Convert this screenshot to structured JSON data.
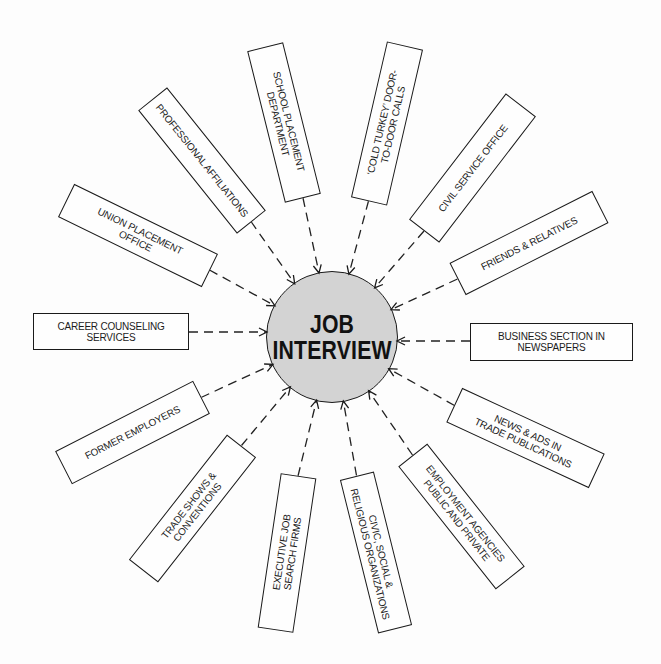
{
  "diagram": {
    "center": {
      "lines": [
        "JOB",
        "INTERVIEW"
      ]
    },
    "sources": [
      {
        "lines": [
          "SCHOOL PLACEMENT",
          "DEPARTMENT"
        ]
      },
      {
        "lines": [
          "‘COLD TURKEY’ DOOR-",
          "TO-DOOR CALLS"
        ]
      },
      {
        "lines": [
          "CIVIL SERVICE OFFICE"
        ]
      },
      {
        "lines": [
          "FRIENDS & RELATIVES"
        ]
      },
      {
        "lines": [
          "BUSINESS SECTION IN",
          "NEWSPAPERS"
        ]
      },
      {
        "lines": [
          "NEWS & ADS IN",
          "TRADE PUBLICATIONS"
        ]
      },
      {
        "lines": [
          "EMPLOYMENT AGENCIES",
          "PUBLIC AND PRIVATE"
        ]
      },
      {
        "lines": [
          "CIVIC, SOCIAL &",
          "RELIGIOUS ORGANIZATIONS"
        ]
      },
      {
        "lines": [
          "EXECUTIVE JOB",
          "SEARCH FIRMS"
        ]
      },
      {
        "lines": [
          "TRADE SHOWS &",
          "CONVENTIONS"
        ]
      },
      {
        "lines": [
          "FORMER EMPLOYERS"
        ]
      },
      {
        "lines": [
          "CAREER COUNSELING",
          "SERVICES"
        ]
      },
      {
        "lines": [
          "UNION PLACEMENT",
          "OFFICE"
        ]
      },
      {
        "lines": [
          "PROFESSIONAL AFFILIATIONS"
        ]
      }
    ],
    "colors": {
      "hub_fill": "#d3d3d3",
      "stroke": "#1a1a1a",
      "background": "#fdfdfd"
    }
  }
}
